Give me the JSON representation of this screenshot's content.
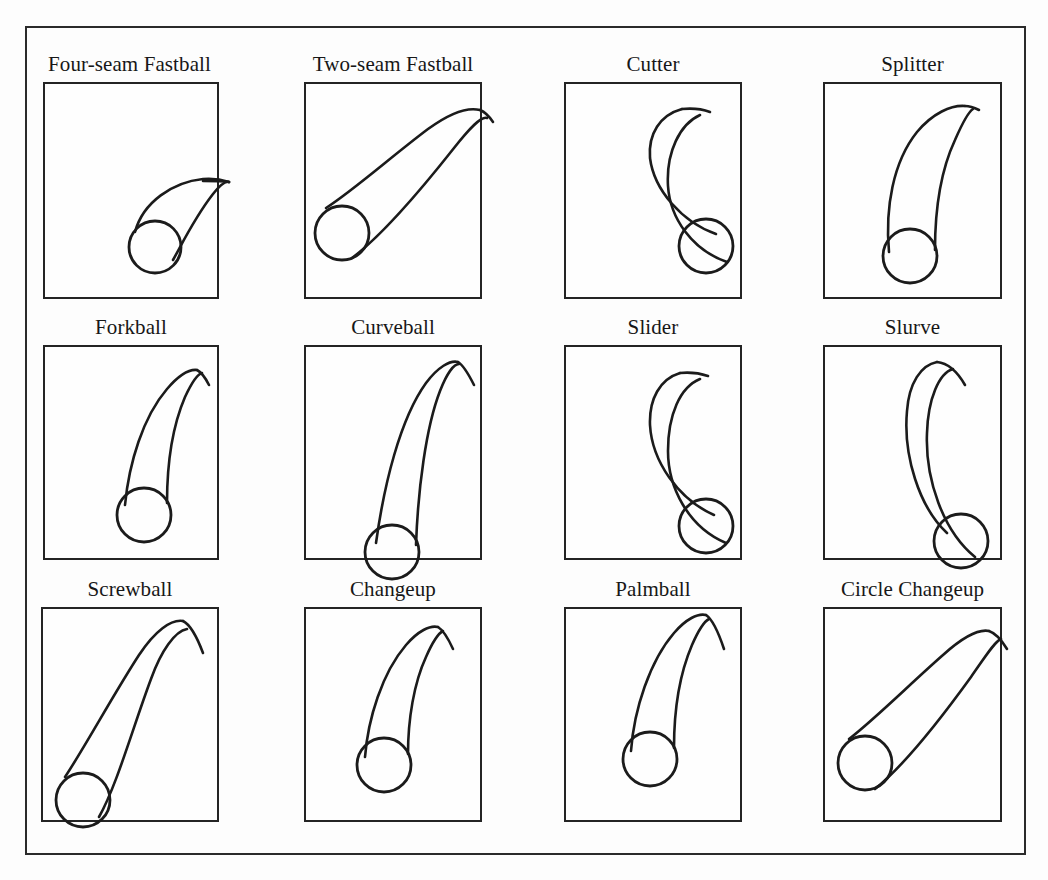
{
  "figure": {
    "columns": 4,
    "rows": 3,
    "frame_color": "#2b2b2b",
    "box_color": "#242424",
    "ink_color": "#1b1b1b",
    "paper_color": "#fdfdfd"
  },
  "panels": [
    {
      "id": "four-seam-fastball",
      "label": "Four-seam Fastball",
      "row": 1,
      "col": 1,
      "label_align": "left",
      "box": {
        "x": 43,
        "y": 82,
        "w": 176,
        "h": 217
      },
      "ball": {
        "cx": 112,
        "cy": 165,
        "r": 26
      },
      "motion": "rises and tails slightly up and to the right, short tight arc",
      "path_top": "M 92 150 C 100 120, 130 100, 160 97 C 172 96, 180 98, 186 100",
      "path_bottom": "M 130 178 C 140 160, 152 135, 170 112 C 178 102, 183 99, 186 100",
      "tail": "M 186 100 C 178 99, 170 99, 160 99"
    },
    {
      "id": "two-seam-fastball",
      "label": "Two-seam Fastball",
      "row": 1,
      "col": 2,
      "label_align": "center",
      "box": {
        "x": 304,
        "y": 82,
        "w": 178,
        "h": 217
      },
      "ball": {
        "cx": 38,
        "cy": 151,
        "r": 27
      },
      "motion": "long sweeping rise from low-left, arm-side run, hooks over at top right",
      "path_top": "M 22 126 C 50 108, 88 74, 124 47 C 146 31, 164 25, 176 28",
      "path_bottom": "M 48 176 C 80 152, 120 104, 150 66 C 166 46, 177 34, 183 36",
      "tail": "M 176 28 C 181 30, 185 34, 189 40"
    },
    {
      "id": "cutter",
      "label": "Cutter",
      "row": 1,
      "col": 3,
      "label_align": "center",
      "box": {
        "x": 564,
        "y": 82,
        "w": 178,
        "h": 217
      },
      "ball": {
        "cx": 142,
        "cy": 164,
        "r": 27
      },
      "motion": "late sharp break down and to the glove side, deep crescent",
      "path_top": "M 152 152 C 118 140, 90 108, 86 76 C 84 52, 96 33, 118 27",
      "path_bottom": "M 163 180 C 128 168, 106 136, 104 104 C 102 70, 116 42, 136 33",
      "tail": "M 118 27 C 128 26, 138 27, 146 30"
    },
    {
      "id": "splitter",
      "label": "Splitter",
      "row": 1,
      "col": 4,
      "label_align": "center",
      "box": {
        "x": 823,
        "y": 82,
        "w": 179,
        "h": 217
      },
      "ball": {
        "cx": 87,
        "cy": 174,
        "r": 27
      },
      "motion": "straight then abrupt late downward dive, narrow vertical loop",
      "path_top": "M 66 170 C 62 126, 70 80, 94 50 C 110 31, 128 23, 142 24",
      "path_bottom": "M 112 168 C 112 128, 118 88, 132 58 C 139 42, 145 30, 150 27",
      "tail": "M 142 24 C 147 24, 152 26, 156 28"
    },
    {
      "id": "forkball",
      "label": "Forkball",
      "row": 2,
      "col": 1,
      "label_align": "center",
      "box": {
        "x": 43,
        "y": 345,
        "w": 176,
        "h": 215
      },
      "ball": {
        "cx": 101,
        "cy": 170,
        "r": 27
      },
      "motion": "tumbling drop, gentle rise then hard fall straight down",
      "path_top": "M 82 160 C 86 118, 100 72, 124 44 C 136 30, 146 24, 154 25",
      "path_bottom": "M 124 158 C 124 118, 130 80, 142 52 C 149 37, 155 29, 159 28",
      "tail": "M 154 25 C 158 27, 162 32, 166 40"
    },
    {
      "id": "curveball",
      "label": "Curveball",
      "row": 2,
      "col": 2,
      "label_align": "center",
      "box": {
        "x": 304,
        "y": 345,
        "w": 178,
        "h": 215
      },
      "ball": {
        "cx": 88,
        "cy": 207,
        "r": 27
      },
      "motion": "big 12-to-6 break, long vertical arc dropping below the zone",
      "path_top": "M 72 198 C 80 140, 96 74, 122 38 C 134 22, 146 15, 154 17",
      "path_bottom": "M 112 200 C 114 144, 122 82, 136 46 C 143 28, 150 19, 155 19",
      "tail": "M 154 17 C 159 20, 164 28, 170 40"
    },
    {
      "id": "slider",
      "label": "Slider",
      "row": 2,
      "col": 3,
      "label_align": "center",
      "box": {
        "x": 564,
        "y": 345,
        "w": 178,
        "h": 215
      },
      "ball": {
        "cx": 142,
        "cy": 181,
        "r": 27
      },
      "motion": "lateral sweep with late downward tilt, wide crescent to glove side",
      "path_top": "M 150 170 C 114 154, 88 116, 86 80 C 85 54, 96 34, 116 28",
      "path_bottom": "M 162 198 C 124 182, 104 142, 104 106 C 104 70, 116 42, 136 34",
      "tail": "M 116 28 C 126 27, 135 28, 144 31"
    },
    {
      "id": "slurve",
      "label": "Slurve",
      "row": 2,
      "col": 4,
      "label_align": "center",
      "box": {
        "x": 823,
        "y": 345,
        "w": 179,
        "h": 215
      },
      "ball": {
        "cx": 138,
        "cy": 196,
        "r": 27
      },
      "motion": "hybrid slider-curve, long sweeping arc that falls and breaks away",
      "path_top": "M 124 188 C 96 162, 80 110, 84 66 C 86 38, 98 20, 114 17",
      "path_bottom": "M 152 212 C 120 186, 102 134, 104 88 C 105 54, 116 28, 130 24",
      "tail": "M 114 17 C 124 18, 134 26, 142 40"
    },
    {
      "id": "screwball",
      "label": "Screwball",
      "row": 3,
      "col": 1,
      "label_align": "center",
      "box": {
        "x": 41,
        "y": 607,
        "w": 178,
        "h": 215
      },
      "ball": {
        "cx": 42,
        "cy": 193,
        "r": 27
      },
      "motion": "reverse break, rises from low-left then breaks back arm-side at apex",
      "path_top": "M 24 170 C 44 140, 72 88, 98 48 C 114 24, 130 12, 142 14",
      "path_bottom": "M 58 210 C 76 178, 92 120, 110 72 C 120 44, 134 24, 146 22",
      "tail": "M 142 14 C 150 18, 156 30, 162 46"
    },
    {
      "id": "changeup",
      "label": "Changeup",
      "row": 3,
      "col": 2,
      "label_align": "center",
      "box": {
        "x": 304,
        "y": 607,
        "w": 178,
        "h": 215
      },
      "ball": {
        "cx": 80,
        "cy": 158,
        "r": 27
      },
      "motion": "fastball look with reduced velocity, late modest fade and drop",
      "path_top": "M 61 150 C 64 112, 78 66, 102 38 C 114 24, 126 18, 134 20",
      "path_bottom": "M 104 147 C 104 112, 110 76, 122 50 C 129 34, 135 26, 139 24",
      "tail": "M 134 20 C 139 23, 144 31, 149 42"
    },
    {
      "id": "palmball",
      "label": "Palmball",
      "row": 3,
      "col": 3,
      "label_align": "center",
      "box": {
        "x": 564,
        "y": 607,
        "w": 178,
        "h": 215
      },
      "ball": {
        "cx": 86,
        "cy": 152,
        "r": 27
      },
      "motion": "slow off-speed pitch, floats upward then falls off sharply",
      "path_top": "M 67 144 C 70 102, 86 54, 110 26 C 122 12, 134 6, 142 8",
      "path_bottom": "M 110 141 C 110 104, 116 66, 128 38, C 135 22, 141 14, 145 12",
      "tail": "M 142 8 C 148 12, 154 24, 160 42"
    },
    {
      "id": "circle-changeup",
      "label": "Circle Changeup",
      "row": 3,
      "col": 4,
      "label_align": "center",
      "box": {
        "x": 823,
        "y": 607,
        "w": 179,
        "h": 215
      },
      "ball": {
        "cx": 42,
        "cy": 156,
        "r": 27
      },
      "motion": "screwball-like arm-side fade, rises from low-left then tumbles right",
      "path_top": "M 26 132 C 52 112, 88 76, 120 48 C 140 30, 156 22, 166 24",
      "path_bottom": "M 52 182 C 84 156, 122 106, 148 70 C 162 50, 172 34, 178 32",
      "tail": "M 166 24 C 172 26, 178 32, 184 42"
    }
  ],
  "caption_remnant": "tops of a cut-off caption line are faintly visible along the bottom edge"
}
